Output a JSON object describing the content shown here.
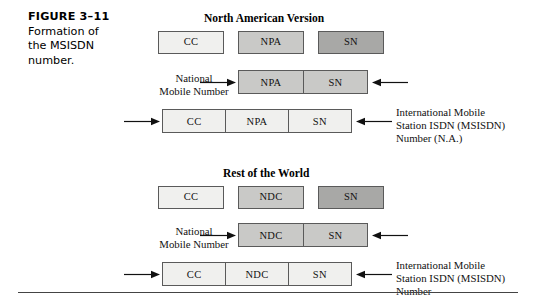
{
  "figure": {
    "number": "FIGURE 3–11",
    "caption_lines": [
      "Formation of",
      "the MSISDN",
      "number."
    ]
  },
  "sections": [
    {
      "id": "north-american-version",
      "title": "North American Version",
      "components": [
        {
          "label": "CC",
          "shade": "light"
        },
        {
          "label": "NPA",
          "shade": "mid"
        },
        {
          "label": "SN",
          "shade": "dark"
        }
      ],
      "national_number": {
        "label_lines": [
          "National",
          "Mobile Number"
        ],
        "segments": [
          {
            "label": "NPA",
            "shade": "mid"
          },
          {
            "label": "SN",
            "shade": "mid"
          }
        ]
      },
      "international_number": {
        "label_lines": [
          "International Mobile",
          "Station ISDN (MSISDN)",
          "Number (N.A.)"
        ],
        "segments": [
          {
            "label": "CC",
            "shade": "light"
          },
          {
            "label": "NPA",
            "shade": "light"
          },
          {
            "label": "SN",
            "shade": "light"
          }
        ]
      }
    },
    {
      "id": "rest-of-the-world",
      "title": "Rest of the World",
      "components": [
        {
          "label": "CC",
          "shade": "light"
        },
        {
          "label": "NDC",
          "shade": "mid"
        },
        {
          "label": "SN",
          "shade": "dark"
        }
      ],
      "national_number": {
        "label_lines": [
          "National",
          "Mobile Number"
        ],
        "segments": [
          {
            "label": "NDC",
            "shade": "mid"
          },
          {
            "label": "SN",
            "shade": "mid"
          }
        ]
      },
      "international_number": {
        "label_lines": [
          "International Mobile",
          "Station ISDN (MSISDN)",
          "Number"
        ],
        "segments": [
          {
            "label": "CC",
            "shade": "light"
          },
          {
            "label": "NDC",
            "shade": "light"
          },
          {
            "label": "SN",
            "shade": "light"
          }
        ]
      }
    }
  ],
  "colors": {
    "shade_light": "#f0f0ee",
    "shade_mid": "#c9c9c7",
    "shade_dark": "#a8a8a6",
    "border": "#5a5a5a",
    "text": "#111111",
    "background": "#ffffff"
  }
}
